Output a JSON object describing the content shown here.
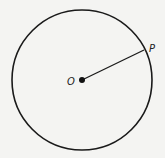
{
  "diagram": {
    "center_label": "O",
    "point_label": "P",
    "colors": {
      "stroke": "#1a1a1a",
      "background": "#f4f4f2"
    }
  }
}
